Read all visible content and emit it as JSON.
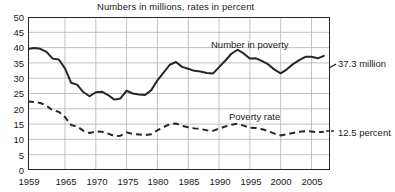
{
  "chart_data": {
    "type": "line",
    "title": "Numbers in millions, rates in percent",
    "xlabel": "",
    "ylabel": "",
    "xlim": [
      1959,
      2008
    ],
    "ylim": [
      0,
      50
    ],
    "grid": true,
    "legend_position": "inline-annotation",
    "ytick_labels": [
      "0",
      "5",
      "10",
      "15",
      "20",
      "25",
      "30",
      "35",
      "40",
      "45",
      "50"
    ],
    "ytick_values": [
      0,
      5,
      10,
      15,
      20,
      25,
      30,
      35,
      40,
      45,
      50
    ],
    "xtick_labels": [
      "1959",
      "1965",
      "1970",
      "1975",
      "1980",
      "1985",
      "1990",
      "1995",
      "2000",
      "2005"
    ],
    "xtick_values": [
      1959,
      1965,
      1970,
      1975,
      1980,
      1985,
      1990,
      1995,
      2000,
      2005
    ],
    "x": [
      1959,
      1960,
      1961,
      1962,
      1963,
      1964,
      1965,
      1966,
      1967,
      1968,
      1969,
      1970,
      1971,
      1972,
      1973,
      1974,
      1975,
      1976,
      1977,
      1978,
      1979,
      1980,
      1981,
      1982,
      1983,
      1984,
      1985,
      1986,
      1987,
      1988,
      1989,
      1990,
      1991,
      1992,
      1993,
      1994,
      1995,
      1996,
      1997,
      1998,
      1999,
      2000,
      2001,
      2002,
      2003,
      2004,
      2005,
      2006,
      2007
    ],
    "series": [
      {
        "name": "Number in poverty",
        "style": "solid",
        "unit": "millions",
        "annotation": "Number in poverty",
        "end_label": "37.3 million",
        "end_value": 37.3,
        "values": [
          39.5,
          39.9,
          39.6,
          38.6,
          36.4,
          36.1,
          33.2,
          28.5,
          27.8,
          25.4,
          24.1,
          25.4,
          25.6,
          24.5,
          23.0,
          23.4,
          25.9,
          25.0,
          24.7,
          24.5,
          26.1,
          29.3,
          31.8,
          34.4,
          35.3,
          33.7,
          33.1,
          32.4,
          32.2,
          31.7,
          31.5,
          33.6,
          35.7,
          38.0,
          39.3,
          38.1,
          36.4,
          36.5,
          35.6,
          34.5,
          32.8,
          31.6,
          32.9,
          34.6,
          35.9,
          37.0,
          37.0,
          36.5,
          37.3
        ]
      },
      {
        "name": "Poverty rate",
        "style": "dashed",
        "unit": "percent",
        "annotation": "Poverty rate",
        "end_label": "12.5 percent",
        "end_value": 12.5,
        "values": [
          22.4,
          22.2,
          21.9,
          21.0,
          19.5,
          19.0,
          17.3,
          14.7,
          14.2,
          12.8,
          12.1,
          12.6,
          12.5,
          11.9,
          11.1,
          11.2,
          12.3,
          11.8,
          11.6,
          11.4,
          11.7,
          13.0,
          14.0,
          15.0,
          15.2,
          14.4,
          14.0,
          13.6,
          13.4,
          13.0,
          12.8,
          13.5,
          14.2,
          14.8,
          15.1,
          14.5,
          13.8,
          13.7,
          13.3,
          12.7,
          11.9,
          11.3,
          11.7,
          12.1,
          12.5,
          12.7,
          12.6,
          12.3,
          12.5
        ]
      }
    ]
  },
  "annotations": {
    "number_in_poverty": "Number in poverty",
    "poverty_rate": "Poverty rate",
    "number_end": "37.3 million",
    "rate_end": "12.5 percent"
  },
  "colors": {
    "line": "#262626",
    "grid": "#b3b3b3",
    "axis": "#262626",
    "background": "#ffffff"
  }
}
